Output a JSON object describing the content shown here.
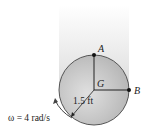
{
  "diagram": {
    "type": "rigid-body disk rotation",
    "points": {
      "top": "A",
      "right": "B",
      "center": "G"
    },
    "radius_label": "1.5 ft",
    "angular_velocity_label": "ω = 4 rad/s",
    "colors": {
      "disk_fill": "#c8c8c8",
      "disk_edge": "#555555",
      "shadow": "#e6e6e6",
      "lines": "#222222"
    }
  }
}
